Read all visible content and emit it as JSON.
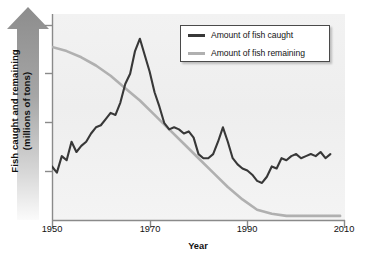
{
  "chart_data": {
    "type": "line",
    "title": "",
    "xlabel": "Year",
    "ylabel": "Fish caught and remaining\n(millions of tons)",
    "xlim": [
      1950,
      2010
    ],
    "ylim": [
      0,
      100
    ],
    "xticks": [
      1950,
      1970,
      1990,
      2010
    ],
    "xticklabels": [
      "1950",
      "1970",
      "1990",
      "2010"
    ],
    "yticks": [
      0,
      25,
      50,
      75,
      100
    ],
    "yticklabels": [
      "",
      "",
      "",
      "",
      ""
    ],
    "grid": false,
    "legend_position": "top-right",
    "series": [
      {
        "name": "Amount of fish caught",
        "color": "#383838",
        "x": [
          1950,
          1951,
          1952,
          1953,
          1954,
          1955,
          1956,
          1957,
          1958,
          1959,
          1960,
          1961,
          1962,
          1963,
          1964,
          1965,
          1966,
          1967,
          1968,
          1969,
          1970,
          1971,
          1972,
          1973,
          1974,
          1975,
          1976,
          1977,
          1978,
          1979,
          1980,
          1981,
          1982,
          1983,
          1984,
          1985,
          1986,
          1987,
          1988,
          1989,
          1990,
          1991,
          1992,
          1993,
          1994,
          1995,
          1996,
          1997,
          1998,
          1999,
          2000,
          2001,
          2002,
          2003,
          2004,
          2005,
          2006,
          2007
        ],
        "y": [
          26,
          23,
          31,
          29,
          38,
          33,
          36,
          38,
          42,
          45,
          46,
          49,
          52,
          51,
          57,
          66,
          71,
          82,
          88,
          80,
          72,
          62,
          55,
          47,
          44,
          45,
          44,
          42,
          43,
          40,
          32,
          30,
          30,
          32,
          38,
          45,
          38,
          30,
          27,
          25,
          24,
          22,
          19,
          18,
          21,
          26,
          25,
          30,
          29,
          31,
          32,
          30,
          31,
          32,
          31,
          33,
          30,
          32
        ]
      },
      {
        "name": "Amount of fish remaining",
        "color": "#b0b0b0",
        "x": [
          1950,
          1953,
          1956,
          1959,
          1962,
          1965,
          1968,
          1971,
          1974,
          1977,
          1980,
          1983,
          1986,
          1989,
          1992,
          1995,
          1998,
          2001,
          2004,
          2007,
          2009
        ],
        "y": [
          84,
          82,
          79,
          75,
          70,
          64,
          58,
          51,
          44,
          37,
          30,
          23,
          16,
          10,
          5,
          3,
          2,
          2,
          2,
          2,
          2
        ]
      }
    ]
  },
  "legend": {
    "items": [
      {
        "label": "Amount of fish caught",
        "color": "#383838"
      },
      {
        "label": "Amount of fish remaining",
        "color": "#b0b0b0"
      }
    ]
  },
  "axis": {
    "y_title": "Fish caught and remaining\n(millions of tons)",
    "x_title": "Year",
    "x_labels": [
      "1950",
      "1970",
      "1990",
      "2010"
    ]
  }
}
